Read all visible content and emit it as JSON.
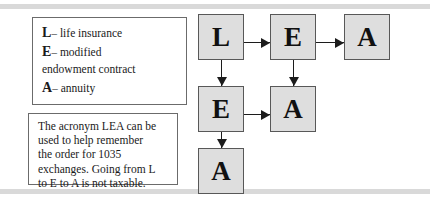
{
  "figure": {
    "legend_box": {
      "lines": [
        {
          "key": "L",
          "dash": "–",
          "text": "life insurance"
        },
        {
          "key": "E",
          "dash": "–",
          "text": "modified"
        },
        {
          "key": "",
          "dash": "",
          "text": "endowment contract"
        },
        {
          "key": "A",
          "dash": "–",
          "text": "annuity"
        }
      ]
    },
    "note_box": {
      "lines": [
        "The acronym LEA can be",
        "used to help remember",
        "the order for 1035",
        "exchanges. Going from L",
        "to E to A is not taxable."
      ]
    },
    "flow": {
      "nodes": [
        {
          "id": "l",
          "label": "L"
        },
        {
          "id": "e1",
          "label": "E"
        },
        {
          "id": "a1",
          "label": "A"
        },
        {
          "id": "e2",
          "label": "E"
        },
        {
          "id": "a2",
          "label": "A"
        },
        {
          "id": "a3",
          "label": "A"
        }
      ],
      "arrows": [
        {
          "id": "l-e1",
          "from": "L",
          "to": "E",
          "direction": "right"
        },
        {
          "id": "e1-a1",
          "from": "E",
          "to": "A",
          "direction": "right"
        },
        {
          "id": "e2-a2",
          "from": "E",
          "to": "A",
          "direction": "right"
        },
        {
          "id": "l-e2",
          "from": "L",
          "to": "E",
          "direction": "down"
        },
        {
          "id": "e1-a2",
          "from": "E",
          "to": "A",
          "direction": "down"
        },
        {
          "id": "e2-a3",
          "from": "E",
          "to": "A",
          "direction": "down"
        }
      ]
    },
    "colors": {
      "node_fill": "#dedede",
      "node_border": "#585858",
      "band": "#d9d9d9",
      "box_border": "#6b6b6b",
      "text": "#1a1a1a"
    }
  }
}
